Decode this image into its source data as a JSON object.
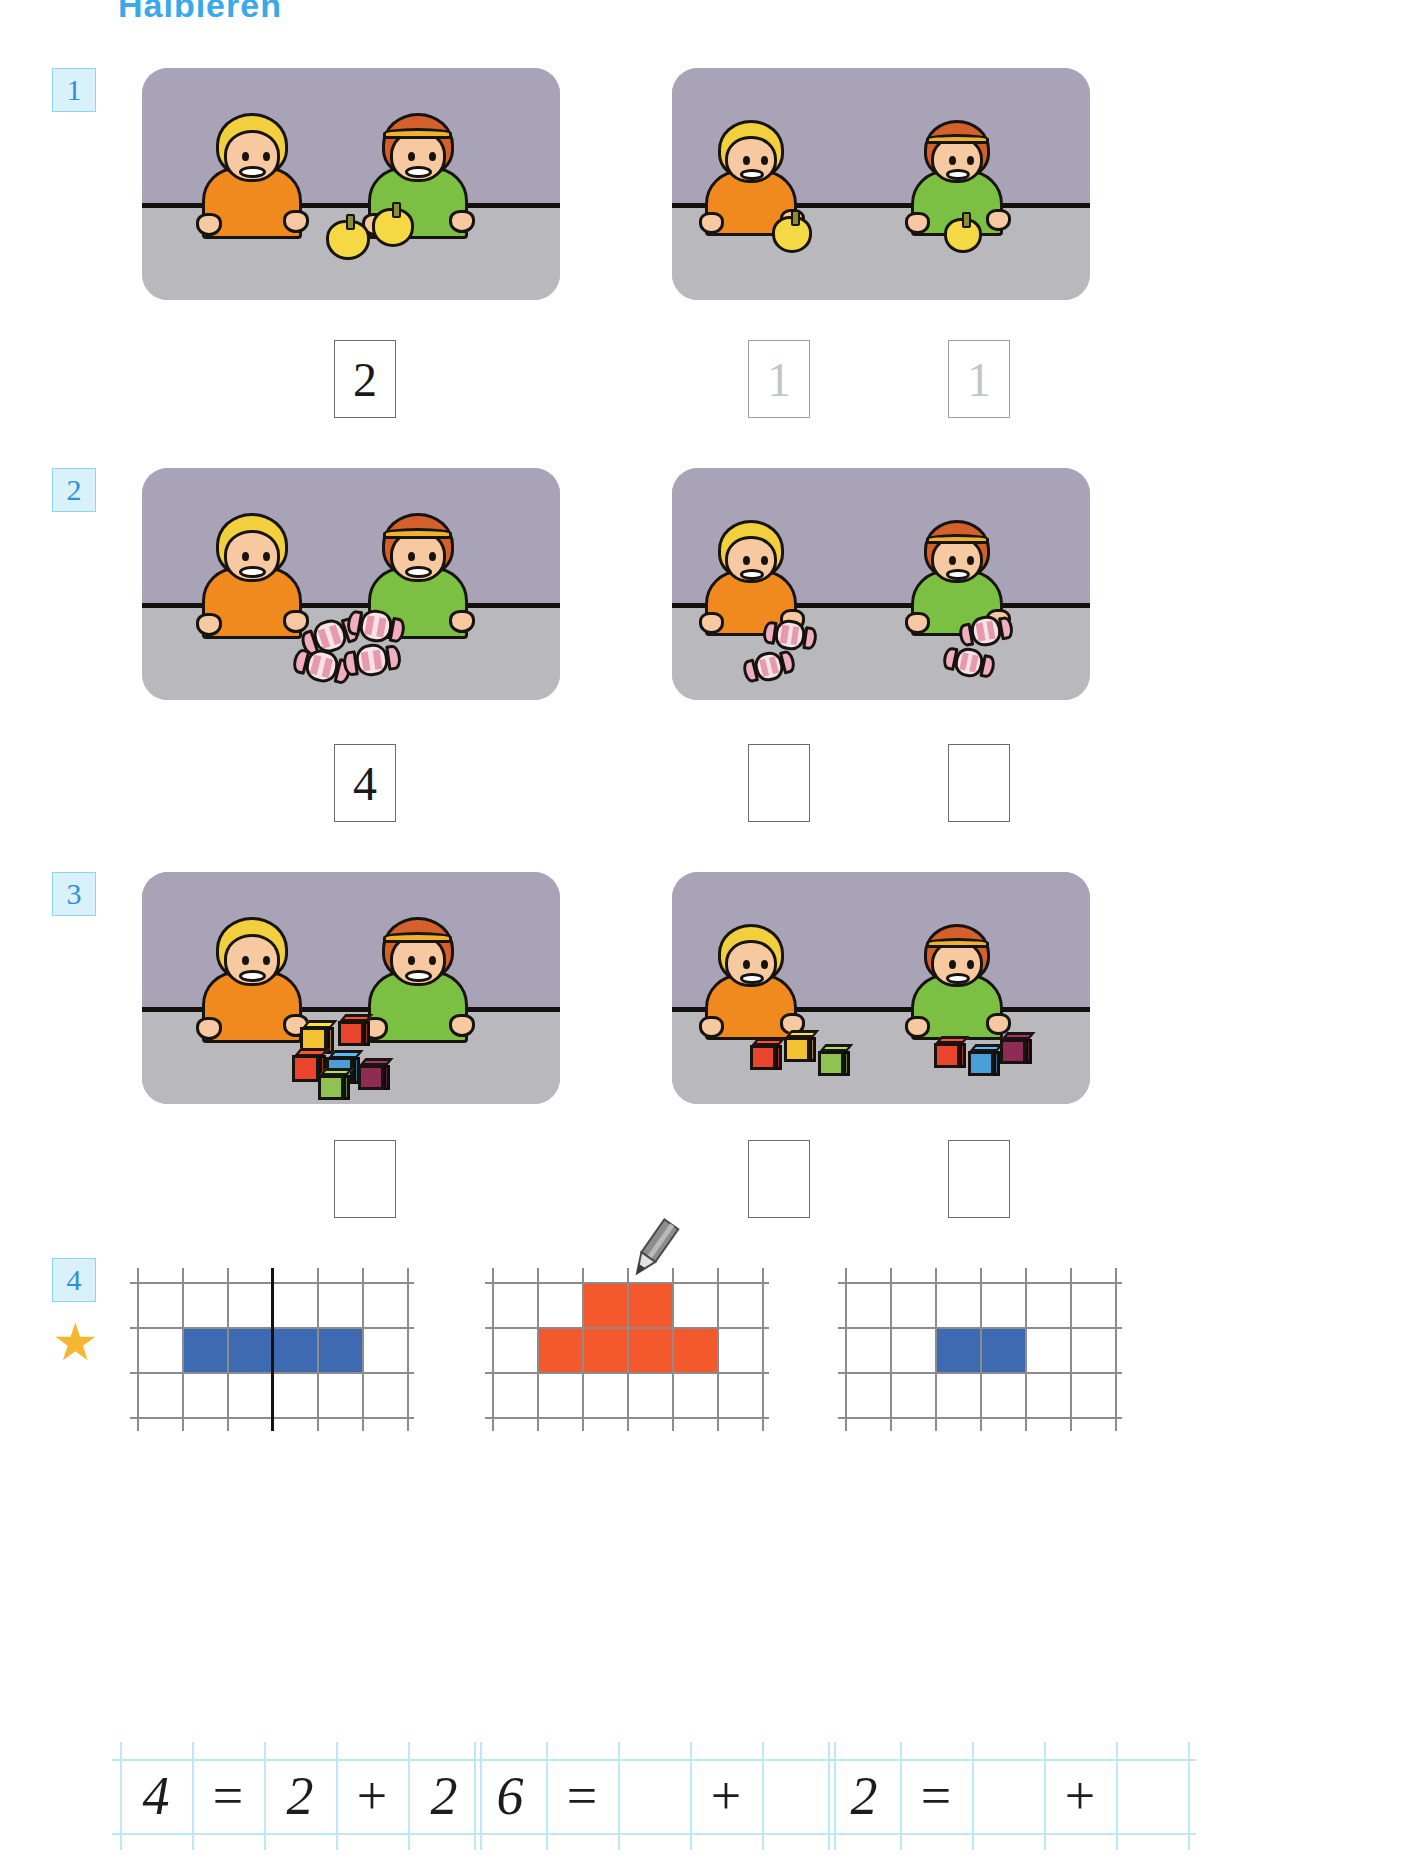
{
  "page": {
    "title": "Halbieren",
    "accent_blue": "#3ba8e8",
    "badge_bg": "#d9f1fb",
    "star_color": "#f5b731"
  },
  "exercises": [
    {
      "number": "1",
      "object": "apple",
      "left_scene": {
        "total_objects": 2,
        "description": "boy and girl at table with 2 apples in middle"
      },
      "right_scene": {
        "left_objects": 1,
        "right_objects": 1,
        "description": "boy holds 1 apple, girl holds 1 apple"
      },
      "answers": [
        {
          "value": "2",
          "state": "filled"
        },
        {
          "value": "1",
          "state": "faint"
        },
        {
          "value": "1",
          "state": "faint"
        }
      ]
    },
    {
      "number": "2",
      "object": "candy",
      "left_scene": {
        "total_objects": 4,
        "description": "boy and girl at table with 4 candies in middle"
      },
      "right_scene": {
        "left_objects": 2,
        "right_objects": 2,
        "description": "boy holds 2 candies, girl holds 2 candies"
      },
      "answers": [
        {
          "value": "4",
          "state": "filled"
        },
        {
          "value": "",
          "state": "empty"
        },
        {
          "value": "",
          "state": "empty"
        }
      ]
    },
    {
      "number": "3",
      "object": "cube",
      "left_scene": {
        "total_objects": 6,
        "description": "boy and girl at table with 6 building cubes in middle"
      },
      "right_scene": {
        "left_objects": 3,
        "right_objects": 3,
        "description": "boy has 3 cubes, girl has 3 cubes"
      },
      "answers": [
        {
          "value": "",
          "state": "empty"
        },
        {
          "value": "",
          "state": "empty"
        },
        {
          "value": "",
          "state": "empty"
        }
      ]
    }
  ],
  "exercise4": {
    "number": "4",
    "star": "★",
    "grids": [
      {
        "name": "grid-blue-four",
        "cols": 6,
        "rows": 3,
        "fill_color": "#3d6ab0",
        "filled_cells": [
          [
            1,
            1
          ],
          [
            1,
            2
          ],
          [
            1,
            3
          ],
          [
            1,
            4
          ]
        ],
        "divider_after_col": 3,
        "has_pencil": false
      },
      {
        "name": "grid-red-six",
        "cols": 6,
        "rows": 3,
        "fill_color": "#f4592e",
        "filled_cells": [
          [
            0,
            2
          ],
          [
            0,
            3
          ],
          [
            1,
            1
          ],
          [
            1,
            2
          ],
          [
            1,
            3
          ],
          [
            1,
            4
          ]
        ],
        "divider_after_col": null,
        "has_pencil": true,
        "pencil_col": 3
      },
      {
        "name": "grid-blue-two",
        "cols": 6,
        "rows": 3,
        "fill_color": "#3d6ab0",
        "filled_cells": [
          [
            1,
            2
          ],
          [
            1,
            3
          ]
        ],
        "divider_after_col": null,
        "has_pencil": false
      }
    ],
    "equations": [
      {
        "name": "equation-4",
        "cells": [
          {
            "text": "4",
            "kind": "number",
            "filled": true
          },
          {
            "text": "=",
            "kind": "op",
            "filled": true
          },
          {
            "text": "2",
            "kind": "number",
            "filled": true
          },
          {
            "text": "+",
            "kind": "op",
            "filled": true
          },
          {
            "text": "2",
            "kind": "number",
            "filled": true
          }
        ]
      },
      {
        "name": "equation-6",
        "cells": [
          {
            "text": "6",
            "kind": "number",
            "filled": true
          },
          {
            "text": "=",
            "kind": "op",
            "filled": true
          },
          {
            "text": "",
            "kind": "number",
            "filled": false
          },
          {
            "text": "+",
            "kind": "op",
            "filled": true
          },
          {
            "text": "",
            "kind": "number",
            "filled": false
          }
        ]
      },
      {
        "name": "equation-2",
        "cells": [
          {
            "text": "2",
            "kind": "number",
            "filled": true
          },
          {
            "text": "=",
            "kind": "op",
            "filled": true
          },
          {
            "text": "",
            "kind": "number",
            "filled": false
          },
          {
            "text": "+",
            "kind": "op",
            "filled": true
          },
          {
            "text": "",
            "kind": "number",
            "filled": false
          }
        ]
      }
    ]
  }
}
